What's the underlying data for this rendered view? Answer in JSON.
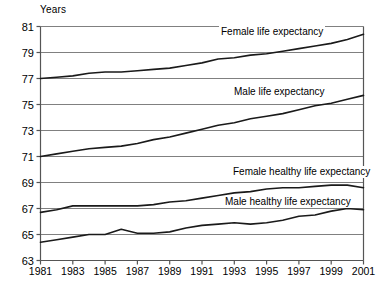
{
  "chart_data": {
    "type": "line",
    "title": "",
    "ylabel": "Years",
    "xlabel": "",
    "ylim": [
      63,
      81
    ],
    "yticks": [
      63,
      65,
      67,
      69,
      71,
      73,
      75,
      77,
      79,
      81
    ],
    "xlim": [
      1981,
      2001
    ],
    "xticks": [
      1981,
      1983,
      1985,
      1987,
      1989,
      1991,
      1993,
      1995,
      1997,
      1999,
      2001
    ],
    "x": [
      1981,
      1982,
      1983,
      1984,
      1985,
      1986,
      1987,
      1988,
      1989,
      1990,
      1991,
      1992,
      1993,
      1994,
      1995,
      1996,
      1997,
      1998,
      1999,
      2000,
      2001
    ],
    "grid": true,
    "legend_position": "inline-labels",
    "series": [
      {
        "name": "Female life expectancy",
        "label_text": "Female life expectancy",
        "values": [
          77.0,
          77.1,
          77.2,
          77.4,
          77.5,
          77.5,
          77.6,
          77.7,
          77.8,
          78.0,
          78.2,
          78.5,
          78.6,
          78.8,
          78.9,
          79.1,
          79.3,
          79.5,
          79.7,
          80.0,
          80.4
        ]
      },
      {
        "name": "Male life expectancy",
        "label_text": "Male life expectancy",
        "values": [
          71.0,
          71.2,
          71.4,
          71.6,
          71.7,
          71.8,
          72.0,
          72.3,
          72.5,
          72.8,
          73.1,
          73.4,
          73.6,
          73.9,
          74.1,
          74.3,
          74.6,
          74.9,
          75.1,
          75.4,
          75.7
        ]
      },
      {
        "name": "Female healthy life expectancy",
        "label_text": "Female healthy life expectancy",
        "values": [
          66.7,
          66.9,
          67.2,
          67.2,
          67.2,
          67.2,
          67.2,
          67.3,
          67.5,
          67.6,
          67.8,
          68.0,
          68.2,
          68.3,
          68.5,
          68.6,
          68.6,
          68.7,
          68.8,
          68.8,
          68.6
        ]
      },
      {
        "name": "Male healthy life expectancy",
        "label_text": "Male healthy life expectancy",
        "values": [
          64.4,
          64.6,
          64.8,
          65.0,
          65.0,
          65.4,
          65.1,
          65.1,
          65.2,
          65.5,
          65.7,
          65.8,
          65.9,
          65.8,
          65.9,
          66.1,
          66.4,
          66.5,
          66.8,
          67.0,
          66.9
        ]
      }
    ],
    "colors": {
      "line": "#1a1a1a",
      "grid": "#808080",
      "axis": "#555555",
      "text": "#000000"
    }
  }
}
